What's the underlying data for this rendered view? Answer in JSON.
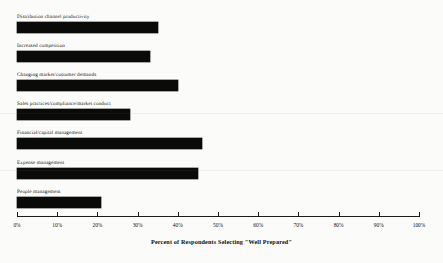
{
  "chart_data": {
    "type": "bar",
    "orientation": "horizontal",
    "title": "",
    "xlabel": "Percent of Respondents Selecting \"Well Prepared\"",
    "ylabel": "",
    "xlim": [
      0,
      100
    ],
    "grid": false,
    "legend": null,
    "categories": [
      "Distribution channel productivity",
      "Increased competition",
      "Changing market/customer demands",
      "Sales practices/compliance/market conduct",
      "Financial/capital management",
      "Expense management",
      "People management"
    ],
    "values": [
      35,
      33,
      40,
      28,
      46,
      45,
      21
    ],
    "value_unit": "%",
    "tick_labels": [
      "0%",
      "10%",
      "20%",
      "30%",
      "40%",
      "50%",
      "60%",
      "70%",
      "80%",
      "90%",
      "100%"
    ],
    "tick_values": [
      0,
      10,
      20,
      30,
      40,
      50,
      60,
      70,
      80,
      90,
      100
    ],
    "bar_color": "#0a0a09",
    "background_color": "#fbfbfa",
    "axis_color": "#1a1a17"
  }
}
